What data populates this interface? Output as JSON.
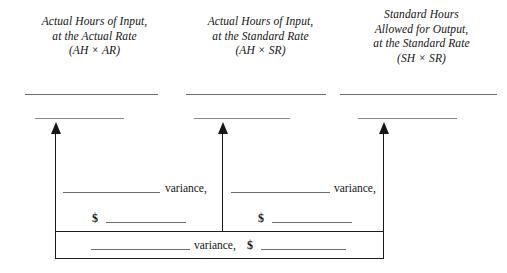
{
  "diagram": {
    "columns": [
      {
        "id": "actual-hours-actual-rate",
        "lines": [
          "Actual Hours of Input,",
          "at the Actual Rate",
          "(AH × AR)"
        ]
      },
      {
        "id": "actual-hours-standard-rate",
        "lines": [
          "Actual Hours of Input,",
          "at the Standard Rate",
          "(AH × SR)"
        ]
      },
      {
        "id": "standard-hours-standard-rate",
        "lines": [
          "Standard Hours",
          "Allowed for Output,",
          "at the Standard Rate",
          "(SH × SR)"
        ]
      }
    ],
    "variance_cells": [
      {
        "id": "left-variance",
        "label": "variance,",
        "currency_symbol": "$"
      },
      {
        "id": "right-variance",
        "label": "variance,",
        "currency_symbol": "$"
      }
    ],
    "total_variance": {
      "id": "total-variance",
      "label": "variance,",
      "currency_symbol": "$"
    },
    "colors": {
      "ink": "#141414",
      "rule": "#6f6f6f",
      "box": "#1b1b1b",
      "background": "#ffffff"
    }
  }
}
